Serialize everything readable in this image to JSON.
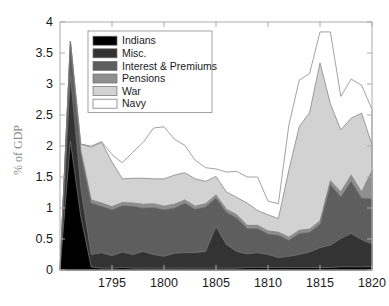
{
  "chart_data": {
    "type": "area",
    "stacked": true,
    "title": "",
    "xlabel": "",
    "ylabel": "% of GDP",
    "xlim": [
      1790,
      1820
    ],
    "ylim": [
      0,
      4
    ],
    "xticks": [
      1795,
      1800,
      1805,
      1810,
      1815,
      1820
    ],
    "xticklabels": [
      "1795",
      "1800",
      "1805",
      "1810",
      "1815",
      "1820"
    ],
    "yticks": [
      0,
      0.5,
      1,
      1.5,
      2,
      2.5,
      3,
      3.5,
      4
    ],
    "yticklabels": [
      "0",
      "0.5",
      "1",
      "1.5",
      "2",
      "2.5",
      "3",
      "3.5",
      "4"
    ],
    "grid": false,
    "legend_position": "upper-left",
    "x": [
      1790,
      1791,
      1792,
      1793,
      1794,
      1795,
      1796,
      1797,
      1798,
      1799,
      1800,
      1801,
      1802,
      1803,
      1804,
      1805,
      1806,
      1807,
      1808,
      1809,
      1810,
      1811,
      1812,
      1813,
      1814,
      1815,
      1816,
      1817,
      1818,
      1819,
      1820
    ],
    "series": [
      {
        "name": "Indians",
        "color": "#000000",
        "values": [
          0.0,
          2.08,
          0.86,
          0.05,
          0.03,
          0.03,
          0.04,
          0.03,
          0.03,
          0.03,
          0.03,
          0.03,
          0.03,
          0.03,
          0.03,
          0.03,
          0.03,
          0.03,
          0.04,
          0.04,
          0.04,
          0.04,
          0.04,
          0.04,
          0.04,
          0.04,
          0.04,
          0.05,
          0.05,
          0.05,
          0.05
        ]
      },
      {
        "name": "Misc.",
        "color": "#333333",
        "values": [
          0.0,
          1.06,
          0.46,
          0.2,
          0.25,
          0.2,
          0.25,
          0.22,
          0.27,
          0.22,
          0.19,
          0.24,
          0.25,
          0.25,
          0.27,
          0.67,
          0.38,
          0.27,
          0.22,
          0.24,
          0.21,
          0.16,
          0.18,
          0.21,
          0.25,
          0.32,
          0.36,
          0.46,
          0.54,
          0.44,
          0.37
        ]
      },
      {
        "name": "Interest & Premiums",
        "color": "#5e5e5e",
        "values": [
          0.0,
          0.5,
          0.56,
          0.83,
          0.75,
          0.74,
          0.75,
          0.78,
          0.7,
          0.76,
          0.75,
          0.73,
          0.8,
          0.7,
          0.72,
          0.46,
          0.52,
          0.54,
          0.41,
          0.39,
          0.33,
          0.36,
          0.26,
          0.34,
          0.32,
          0.38,
          0.98,
          0.67,
          0.84,
          0.67,
          0.73
        ]
      },
      {
        "name": "Pensions",
        "color": "#8f8f8f",
        "values": [
          0.0,
          0.05,
          0.05,
          0.05,
          0.05,
          0.05,
          0.05,
          0.05,
          0.06,
          0.06,
          0.06,
          0.06,
          0.05,
          0.05,
          0.05,
          0.05,
          0.05,
          0.05,
          0.05,
          0.05,
          0.05,
          0.05,
          0.05,
          0.05,
          0.05,
          0.05,
          0.06,
          0.08,
          0.1,
          0.1,
          0.45
        ]
      },
      {
        "name": "War",
        "color": "#d2d2d2",
        "values": [
          0.0,
          0.0,
          0.1,
          0.85,
          0.98,
          0.72,
          0.38,
          0.4,
          0.42,
          0.4,
          0.44,
          0.47,
          0.44,
          0.44,
          0.36,
          0.3,
          0.28,
          0.28,
          0.36,
          0.24,
          0.26,
          0.22,
          1.08,
          1.67,
          1.88,
          2.55,
          1.24,
          1.0,
          0.92,
          1.27,
          0.42
        ]
      },
      {
        "name": "Navy",
        "color": "#ffffff",
        "values": [
          0.0,
          0.0,
          0.0,
          0.02,
          0.01,
          0.12,
          0.26,
          0.42,
          0.58,
          0.82,
          0.84,
          0.58,
          0.44,
          0.3,
          0.22,
          0.12,
          0.32,
          0.42,
          0.42,
          0.54,
          0.22,
          0.24,
          0.72,
          0.75,
          0.63,
          0.5,
          1.16,
          0.54,
          0.63,
          0.45,
          0.57
        ]
      }
    ],
    "legend": [
      {
        "label": "Indians",
        "color": "#000000"
      },
      {
        "label": "Misc.",
        "color": "#333333"
      },
      {
        "label": "Interest & Premiums",
        "color": "#5e5e5e"
      },
      {
        "label": "Pensions",
        "color": "#8f8f8f"
      },
      {
        "label": "War",
        "color": "#d2d2d2"
      },
      {
        "label": "Navy",
        "color": "#ffffff"
      }
    ],
    "axis_color": "#aaaaaa",
    "series_edge_color": "#7a7a7a"
  }
}
